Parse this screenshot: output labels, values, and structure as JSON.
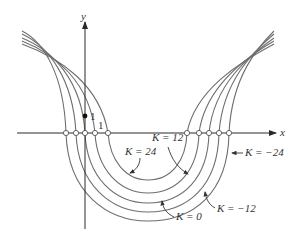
{
  "diagram": {
    "type": "level-curves",
    "axes": {
      "x_label": "x",
      "y_label": "y",
      "x_tick_label": "1",
      "y_tick_label": "1"
    },
    "curves": [
      {
        "K": "24",
        "label": "K = 24"
      },
      {
        "K": "12",
        "label": "K = 12"
      },
      {
        "K": "0",
        "label": "K = 0"
      },
      {
        "K": "-12",
        "label": "K = −12"
      },
      {
        "K": "-24",
        "label": "K = −24"
      }
    ],
    "labels": {
      "k24": "K = 24",
      "k12": "K = 12",
      "k0": "K = 0",
      "km12": "K = −12",
      "km24": "K = −24"
    },
    "colors": {
      "curve": "#6e6e6e",
      "axis": "#2a2a2a",
      "text": "#333333"
    }
  }
}
